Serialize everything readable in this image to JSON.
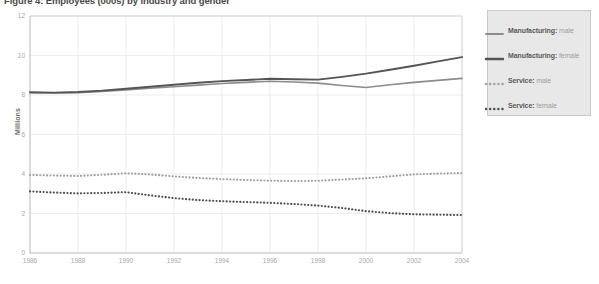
{
  "figure": {
    "title": "Figure 4: Employees (000s) by industry and gender"
  },
  "legend": {
    "items": [
      {
        "category": "Manufacturing:",
        "gender": "male",
        "style": "solid-light",
        "color": "#8c8c8c"
      },
      {
        "category": "Manufacturing:",
        "gender": "female",
        "style": "solid-dark",
        "color": "#555555"
      },
      {
        "category": "Service:",
        "gender": "male",
        "style": "dotted-light",
        "color": "#a0a0a0"
      },
      {
        "category": "Service:",
        "gender": "female",
        "style": "dotted-dark",
        "color": "#4d4d4d"
      }
    ]
  },
  "chart_data": {
    "type": "line",
    "title": "Figure 4: Employees (000s) by industry and gender",
    "xlabel": "",
    "ylabel": "Millions",
    "xlim": [
      1986,
      2004
    ],
    "ylim": [
      0,
      12
    ],
    "yticks": [
      0,
      2,
      4,
      6,
      8,
      10,
      12
    ],
    "xticks": [
      1986,
      1988,
      1990,
      1992,
      1994,
      1996,
      1998,
      2000,
      2002,
      2004
    ],
    "grid": true,
    "legend_position": "right",
    "x": [
      1986,
      1987,
      1988,
      1989,
      1990,
      1991,
      1992,
      1993,
      1994,
      1995,
      1996,
      1997,
      1998,
      1999,
      2000,
      2001,
      2002,
      2003,
      2004
    ],
    "series": [
      {
        "name": "Manufacturing: male",
        "values": [
          8.12,
          8.1,
          8.12,
          8.18,
          8.26,
          8.34,
          8.42,
          8.5,
          8.58,
          8.64,
          8.7,
          8.66,
          8.6,
          8.48,
          8.38,
          8.52,
          8.64,
          8.74,
          8.84
        ],
        "color": "#8c8c8c",
        "style": "solid"
      },
      {
        "name": "Manufacturing: female",
        "values": [
          8.14,
          8.12,
          8.15,
          8.22,
          8.32,
          8.42,
          8.52,
          8.62,
          8.7,
          8.76,
          8.82,
          8.8,
          8.78,
          8.92,
          9.08,
          9.28,
          9.48,
          9.7,
          9.92
        ],
        "color": "#555555",
        "style": "solid"
      },
      {
        "name": "Service: male",
        "values": [
          3.95,
          3.92,
          3.9,
          3.96,
          4.04,
          3.98,
          3.88,
          3.8,
          3.74,
          3.7,
          3.66,
          3.64,
          3.66,
          3.72,
          3.78,
          3.88,
          3.98,
          4.02,
          4.05
        ],
        "color": "#a0a0a0",
        "style": "dotted"
      },
      {
        "name": "Service: female",
        "values": [
          3.12,
          3.06,
          3.02,
          3.04,
          3.08,
          2.92,
          2.78,
          2.68,
          2.62,
          2.58,
          2.54,
          2.48,
          2.4,
          2.28,
          2.12,
          2.02,
          1.96,
          1.94,
          1.92
        ],
        "color": "#4d4d4d",
        "style": "dotted"
      }
    ]
  }
}
